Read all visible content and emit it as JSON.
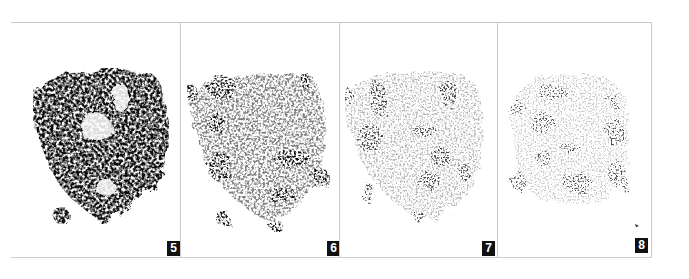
{
  "figure": {
    "panels": [
      {
        "label": "5",
        "density": "dense"
      },
      {
        "label": "6",
        "density": "medium"
      },
      {
        "label": "7",
        "density": "light"
      },
      {
        "label": "8",
        "density": "sparse"
      }
    ]
  },
  "colors": {
    "ink": "#111111",
    "border": "#c8c8c8",
    "background": "#ffffff"
  }
}
